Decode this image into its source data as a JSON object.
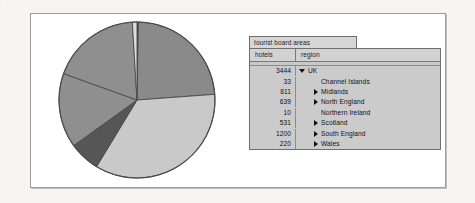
{
  "window": {
    "title": "tourist board areas"
  },
  "table": {
    "columns": [
      "hotels",
      "region"
    ],
    "rows": [
      {
        "hotels": "3444",
        "region": "UK",
        "marker": "triangle-down",
        "indent": 0
      },
      {
        "hotels": "33",
        "region": "Channel Islands",
        "marker": "none",
        "indent": 2
      },
      {
        "hotels": "811",
        "region": "Midlands",
        "marker": "triangle-right",
        "indent": 1
      },
      {
        "hotels": "639",
        "region": "North England",
        "marker": "triangle-right",
        "indent": 1
      },
      {
        "hotels": "10",
        "region": "Northern Ireland",
        "marker": "none",
        "indent": 2
      },
      {
        "hotels": "531",
        "region": "Scotland",
        "marker": "triangle-right",
        "indent": 1
      },
      {
        "hotels": "1200",
        "region": "South England",
        "marker": "triangle-right",
        "indent": 1
      },
      {
        "hotels": "220",
        "region": "Wales",
        "marker": "triangle-right",
        "indent": 1
      }
    ]
  },
  "chart_data": {
    "type": "pie",
    "title": "",
    "value_label": "hotels",
    "total": 3444,
    "start_angle_deg": 0,
    "direction": "clockwise",
    "categories": [
      "Midlands",
      "South England",
      "Wales",
      "Scotland",
      "North England",
      "Channel Islands",
      "Northern Ireland"
    ],
    "values": [
      811,
      1200,
      220,
      531,
      639,
      33,
      10
    ],
    "colors": [
      "#8a8a8a",
      "#c9c9c9",
      "#565656",
      "#8f8f8f",
      "#8f8f8f",
      "#dcdcdc",
      "#3a3a3a"
    ],
    "slices": [
      {
        "label": "Northern Ireland",
        "value": 10,
        "percent": 0.3,
        "color": "#3a3a3a"
      },
      {
        "label": "Midlands",
        "value": 811,
        "percent": 23.5,
        "color": "#8a8a8a"
      },
      {
        "label": "South England",
        "value": 1200,
        "percent": 34.8,
        "color": "#c9c9c9"
      },
      {
        "label": "Wales",
        "value": 220,
        "percent": 6.4,
        "color": "#565656"
      },
      {
        "label": "Scotland",
        "value": 531,
        "percent": 15.4,
        "color": "#8f8f8f"
      },
      {
        "label": "North England",
        "value": 639,
        "percent": 18.6,
        "color": "#8f8f8f"
      },
      {
        "label": "Channel Islands",
        "value": 33,
        "percent": 1.0,
        "color": "#dcdcdc"
      }
    ],
    "legend": "none",
    "grid": false
  },
  "colors": {
    "panel_bg": "#ffffff",
    "panel_border": "#9a9a9a",
    "window_bg": "#cfcfcf",
    "page_bg": "#f6f5f3",
    "text": "#111111"
  }
}
